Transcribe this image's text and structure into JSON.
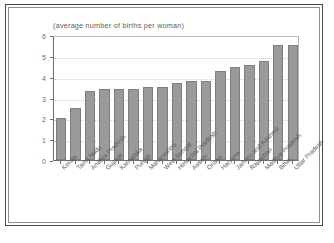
{
  "chart_data": {
    "type": "bar",
    "title": "(average number of births per woman)",
    "xlabel": "",
    "ylabel": "",
    "ylim": [
      0,
      6
    ],
    "yticks": [
      0,
      1,
      2,
      3,
      4,
      5,
      6
    ],
    "grid": true,
    "legend": "none",
    "bar_color": "#9a9a9a",
    "bar_border_color": "#7e7e7e",
    "categories": [
      "Kerala",
      "Tamil Nadu",
      "Andhra Pradesh",
      "Gujarat",
      "Karnataka",
      "Punjab",
      "Maharashtra",
      "West Bengal",
      "Himachal Pradesh",
      "Assam",
      "Orissa",
      "Haryana",
      "Jammu and Kashmir",
      "Rajasthan",
      "Madhya Pradesh",
      "Bihar",
      "Uttar Pradesh"
    ],
    "values": [
      2.0,
      2.5,
      3.3,
      3.4,
      3.4,
      3.4,
      3.5,
      3.5,
      3.7,
      3.8,
      3.8,
      4.25,
      4.45,
      4.55,
      4.75,
      5.5,
      5.5
    ]
  }
}
